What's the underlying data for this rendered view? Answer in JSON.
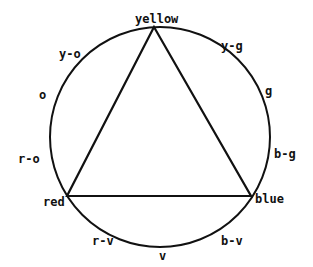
{
  "diagram": {
    "vertices": {
      "top": "yellow",
      "left": "red",
      "right": "blue"
    },
    "labels": {
      "y_o": "y-o",
      "o": "o",
      "r_o": "r-o",
      "y_g": "y-g",
      "g": "g",
      "b_g": "b-g",
      "r_v": "r-v",
      "v": "v",
      "b_v": "b-v"
    },
    "stroke_color": "#111111",
    "background": "#ffffff"
  }
}
